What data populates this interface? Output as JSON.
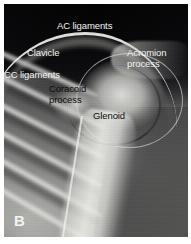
{
  "figure": {
    "panel_letter": "B",
    "modality": "radiograph",
    "view": "shoulder"
  },
  "annotations": [
    {
      "id": "ac-ligaments",
      "text": "AC ligaments",
      "tone": "light",
      "x": 57,
      "y": 21,
      "align": "left"
    },
    {
      "id": "clavicle",
      "text": "Clavicle",
      "tone": "light",
      "x": 27,
      "y": 48,
      "align": "left"
    },
    {
      "id": "acromion-process",
      "text": "Acromion\nprocess",
      "tone": "light",
      "x": 127,
      "y": 48,
      "align": "left"
    },
    {
      "id": "cc-ligaments",
      "text": "CC ligaments",
      "tone": "light",
      "x": 4,
      "y": 70,
      "align": "left"
    },
    {
      "id": "coracoid-process",
      "text": "Coracoid\nprocess",
      "tone": "dark",
      "x": 49,
      "y": 84,
      "align": "left"
    },
    {
      "id": "glenoid",
      "text": "Glenoid",
      "tone": "dark",
      "x": 93,
      "y": 111,
      "align": "left"
    }
  ],
  "anatomy_structures": [
    {
      "id": "clavicle-arc",
      "label": "clavicle"
    },
    {
      "id": "humeral-head",
      "label": "humeral head"
    },
    {
      "id": "glenoid-arc",
      "label": "glenoid fossa"
    },
    {
      "id": "acromion",
      "label": "acromion process"
    },
    {
      "id": "coracoid",
      "label": "coracoid process"
    },
    {
      "id": "humeral-shaft",
      "label": "humeral shaft"
    },
    {
      "id": "rib-cage",
      "label": "rib cage"
    }
  ],
  "colors": {
    "page_background": "#ffffff",
    "film_dark": "#07070a",
    "bone_bright": "#ecece8",
    "label_light": "#f2f2f0",
    "label_dark": "#0d0d0d"
  }
}
